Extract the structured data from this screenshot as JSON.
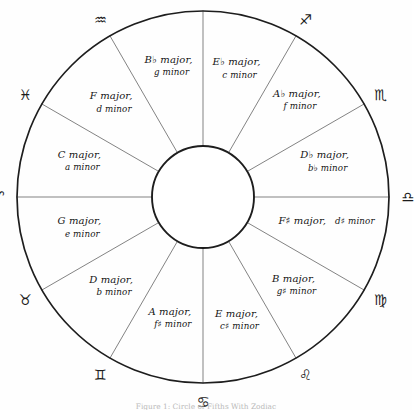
{
  "figure": {
    "title": "Circle of Fifths",
    "caption": "Figure 1: Circle of Fifths With Zodiac",
    "inner_circle_label": "",
    "ink_color": "#1d1d1d",
    "spoke_color": "#6d6d6d",
    "background_color": "#fefefe"
  },
  "chart_data": {
    "type": "pie",
    "title": "Circle of Fifths",
    "xlabel": "",
    "ylabel": "",
    "legend_position": "none",
    "grid": false,
    "sector_count": 12,
    "categories": [
      "E-flat major / c minor",
      "A-flat major / f minor",
      "D-flat major / b-flat minor",
      "F-sharp major / d-sharp minor",
      "B major / g-sharp minor",
      "E major / c-sharp minor",
      "A major / f-sharp minor",
      "D major / b minor",
      "G major / e minor",
      "C major / a minor",
      "F major / d minor",
      "B-flat major / g minor"
    ],
    "values": [
      30,
      30,
      30,
      30,
      30,
      30,
      30,
      30,
      30,
      30,
      30,
      30
    ],
    "annotations": [
      "Capricorn",
      "Sagittarius",
      "Scorpio",
      "Libra",
      "Virgo",
      "Leo",
      "Cancer",
      "Gemini",
      "Taurus",
      "Aries",
      "Pisces",
      "Aquarius"
    ]
  },
  "sectors": [
    {
      "id": "e-flat-major",
      "major": "E♭ major,",
      "minor": "c minor",
      "major_root": "E",
      "major_accidental": "♭",
      "center_angle_deg": -75,
      "label_radius": 130,
      "layout": "two-line"
    },
    {
      "id": "a-flat-major",
      "major": "A♭ major,",
      "minor": "f minor",
      "major_root": "A",
      "major_accidental": "♭",
      "center_angle_deg": -45,
      "label_radius": 133,
      "layout": "two-line"
    },
    {
      "id": "d-flat-major",
      "major": "D♭ major,",
      "minor": "b♭ minor",
      "major_root": "D",
      "major_accidental": "♭",
      "center_angle_deg": -15,
      "label_radius": 126,
      "layout": "two-line"
    },
    {
      "id": "f-sharp-major",
      "major": "F♯ major,",
      "minor": "d♯ minor",
      "major_root": "F",
      "major_accidental": "♯",
      "center_angle_deg": 15,
      "label_radius": 128,
      "layout": "one-line"
    },
    {
      "id": "b-major",
      "major": "B major,",
      "minor": "g♯ minor",
      "major_root": "B",
      "major_accidental": "",
      "center_angle_deg": 45,
      "label_radius": 128,
      "layout": "two-line"
    },
    {
      "id": "e-major",
      "major": "E major,",
      "minor": "c♯ minor",
      "major_root": "E",
      "major_accidental": "",
      "center_angle_deg": 75,
      "label_radius": 130,
      "layout": "two-line"
    },
    {
      "id": "a-major",
      "major": "A major,",
      "minor": "f♯ minor",
      "major_root": "A",
      "major_accidental": "",
      "center_angle_deg": 105,
      "label_radius": 128,
      "layout": "two-line"
    },
    {
      "id": "d-major",
      "major": "D major,",
      "minor": "b minor",
      "major_root": "D",
      "major_accidental": "",
      "center_angle_deg": 135,
      "label_radius": 130,
      "layout": "two-line"
    },
    {
      "id": "g-major",
      "major": "G major,",
      "minor": "e minor",
      "major_root": "G",
      "major_accidental": "",
      "center_angle_deg": 165,
      "label_radius": 128,
      "layout": "two-line"
    },
    {
      "id": "c-major",
      "major": "C major,",
      "minor": "a minor",
      "major_root": "C",
      "major_accidental": "",
      "center_angle_deg": 195,
      "label_radius": 128,
      "layout": "two-line"
    },
    {
      "id": "f-major",
      "major": "F major,",
      "minor": "d minor",
      "major_root": "F",
      "major_accidental": "",
      "center_angle_deg": 225,
      "label_radius": 130,
      "layout": "two-line"
    },
    {
      "id": "b-flat-major",
      "major": "B♭ major,",
      "minor": "g minor",
      "major_root": "B",
      "major_accidental": "♭",
      "center_angle_deg": 255,
      "label_radius": 133,
      "layout": "two-line"
    }
  ],
  "zodiac": [
    {
      "id": "capricorn",
      "name": "Capricorn",
      "glyph": "♑",
      "angle_deg": -90,
      "radius": 205
    },
    {
      "id": "sagittarius",
      "name": "Sagittarius",
      "glyph": "♐",
      "angle_deg": -60,
      "radius": 205
    },
    {
      "id": "scorpio",
      "name": "Scorpio",
      "glyph": "♏",
      "angle_deg": -30,
      "radius": 205
    },
    {
      "id": "libra",
      "name": "Libra",
      "glyph": "♎",
      "angle_deg": 0,
      "radius": 205
    },
    {
      "id": "virgo",
      "name": "Virgo",
      "glyph": "♍",
      "angle_deg": 30,
      "radius": 205
    },
    {
      "id": "leo",
      "name": "Leo",
      "glyph": "♌",
      "angle_deg": 60,
      "radius": 205
    },
    {
      "id": "cancer",
      "name": "Cancer",
      "glyph": "♋",
      "angle_deg": 90,
      "radius": 205
    },
    {
      "id": "gemini",
      "name": "Gemini",
      "glyph": "♊",
      "angle_deg": 120,
      "radius": 205
    },
    {
      "id": "taurus",
      "name": "Taurus",
      "glyph": "♉",
      "angle_deg": 150,
      "radius": 205
    },
    {
      "id": "aries",
      "name": "Aries",
      "glyph": "♈",
      "angle_deg": 180,
      "radius": 205
    },
    {
      "id": "pisces",
      "name": "Pisces",
      "glyph": "♓",
      "angle_deg": 210,
      "radius": 205
    },
    {
      "id": "aquarius",
      "name": "Aquarius",
      "glyph": "♒",
      "angle_deg": 240,
      "radius": 205
    }
  ],
  "geometry": {
    "center_x": 203,
    "center_y": 197,
    "outer_radius": 186,
    "inner_radius": 51
  }
}
